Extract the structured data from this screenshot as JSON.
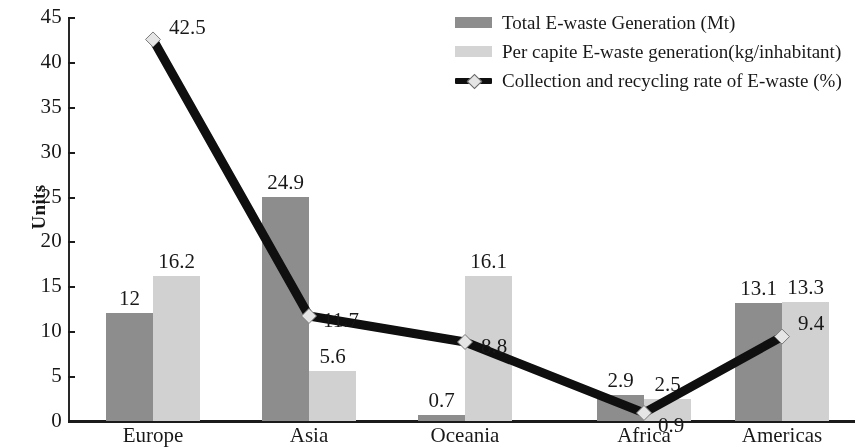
{
  "chart_data": {
    "type": "bar",
    "title": "",
    "xlabel": "",
    "ylabel": "Units",
    "ylim": [
      0,
      45
    ],
    "ytick_step": 5,
    "yticks": [
      "45",
      "40",
      "35",
      "30",
      "25",
      "20",
      "15",
      "10",
      "5",
      "0"
    ],
    "grid": false,
    "legend_position": "top-right",
    "categories": [
      "Europe",
      "Asia",
      "Oceania",
      "Africa",
      "Americas"
    ],
    "series": [
      {
        "name": "Total E-waste Generation (Mt)",
        "type": "bar",
        "color": "#8d8d8d",
        "values": [
          12,
          24.9,
          0.7,
          2.9,
          13.1
        ],
        "labels": [
          "12",
          "24.9",
          "0.7",
          "2.9",
          "13.1"
        ]
      },
      {
        "name": "Per capite E-waste generation(kg/inhabitant)",
        "type": "bar",
        "color": "#cfcfcf",
        "values": [
          16.2,
          5.6,
          16.1,
          2.5,
          13.3
        ],
        "labels": [
          "16.2",
          "5.6",
          "16.1",
          "2.5",
          "13.3"
        ]
      },
      {
        "name": "Collection and recycling rate of E-waste (%)",
        "type": "line",
        "color": "#111111",
        "marker_color": "#e3e3e3",
        "values": [
          42.5,
          11.7,
          8.8,
          0.9,
          9.4
        ],
        "labels": [
          "42.5",
          "11.7",
          "8.8",
          "0.9",
          "9.4"
        ]
      }
    ]
  },
  "axis": {
    "y_title": "Units"
  },
  "legend": {
    "items": [
      {
        "label": "Total E-waste Generation (Mt)",
        "marker": "square-dark"
      },
      {
        "label": "Per capite E-waste generation(kg/inhabitant)",
        "marker": "square-light"
      },
      {
        "label": "Collection and recycling rate of E-waste (%)",
        "marker": "line-diamond"
      }
    ]
  }
}
